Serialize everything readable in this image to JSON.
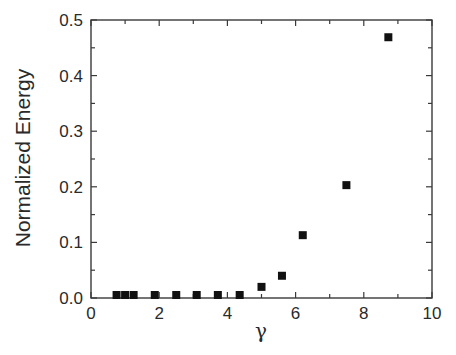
{
  "chart_data": {
    "type": "scatter",
    "title": "",
    "xlabel": "γ",
    "ylabel": "Normalized Energy",
    "xlim": [
      0,
      10
    ],
    "ylim": [
      0,
      0.5
    ],
    "x_ticks": [
      0,
      2,
      4,
      6,
      8,
      10
    ],
    "x_tick_labels": [
      "0",
      "2",
      "4",
      "6",
      "8",
      "10"
    ],
    "x_minor_ticks": [
      1,
      3,
      5,
      7,
      9
    ],
    "y_ticks": [
      0.0,
      0.1,
      0.2,
      0.3,
      0.4,
      0.5
    ],
    "y_tick_labels": [
      "0.0",
      "0.1",
      "0.2",
      "0.3",
      "0.4",
      "0.5"
    ],
    "y_minor_ticks": [
      0.05,
      0.15,
      0.25,
      0.35,
      0.45
    ],
    "grid": false,
    "legend": null,
    "marker": "filled-square",
    "series": [
      {
        "name": "Normalized Energy",
        "x": [
          0.75,
          1.0,
          1.25,
          1.87,
          2.5,
          3.1,
          3.72,
          4.36,
          5.0,
          5.6,
          6.21,
          7.49,
          8.72
        ],
        "y": [
          0.003,
          0.003,
          0.003,
          0.003,
          0.002,
          0.005,
          0.005,
          0.005,
          0.02,
          0.04,
          0.113,
          0.203,
          0.469
        ]
      }
    ]
  },
  "colors": {
    "marker": "#111111",
    "axis": "#3a3a3a",
    "text": "#2a2a2a",
    "background": "#ffffff"
  }
}
